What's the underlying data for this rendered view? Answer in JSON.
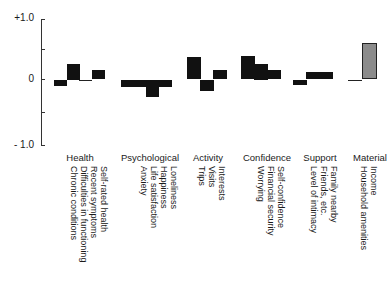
{
  "chart_data": {
    "type": "bar",
    "title": "",
    "xlabel": "",
    "ylabel": "",
    "ylim": [
      -1.0,
      1.0
    ],
    "yticks": [
      "+1.0",
      "0",
      "- 1.0"
    ],
    "grid": false,
    "legend": null,
    "groups": [
      {
        "name": "Health",
        "items": [
          {
            "label": "Chronic conditions",
            "value": -0.1
          },
          {
            "label": "Difficulties in functioning",
            "value": 0.25
          },
          {
            "label": "Recent symptoms",
            "value": 0.0
          },
          {
            "label": "Self-rated health",
            "value": 0.15
          }
        ]
      },
      {
        "name": "Psychological",
        "items": [
          {
            "label": "Anxiety",
            "value": -0.12
          },
          {
            "label": "Life satisfaction",
            "value": -0.12
          },
          {
            "label": "Happiness",
            "value": -0.28
          },
          {
            "label": "Loneliness",
            "value": -0.12
          }
        ]
      },
      {
        "name": "Activity",
        "items": [
          {
            "label": "Trips",
            "value": 0.35
          },
          {
            "label": "Visits",
            "value": -0.18
          },
          {
            "label": "Interests",
            "value": 0.15
          }
        ]
      },
      {
        "name": "Confidence",
        "items": [
          {
            "label": "Worrying",
            "value": 0.38
          },
          {
            "label": "Financial security",
            "value": 0.25
          },
          {
            "label": "Self-confidence",
            "value": 0.15
          }
        ]
      },
      {
        "name": "Support",
        "items": [
          {
            "label": "Level of intimacy",
            "value": -0.08
          },
          {
            "label": "Friends, etc.",
            "value": 0.12
          },
          {
            "label": "Family nearby",
            "value": 0.12
          }
        ]
      },
      {
        "name": "Material",
        "items": [
          {
            "label": "Household amenities",
            "value": 0.0
          },
          {
            "label": "Income",
            "value": 0.58,
            "style": "hatched"
          }
        ]
      }
    ]
  },
  "colors": {
    "bar": "#111111",
    "hatched_bar": "#bbbbbb",
    "axis": "#333333"
  }
}
